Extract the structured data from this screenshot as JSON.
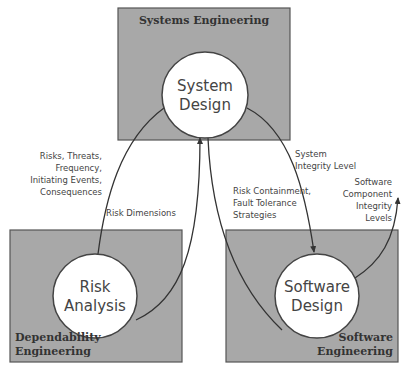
{
  "domains": {
    "systems": {
      "title": "Systems Engineering",
      "node": [
        "System",
        "Design"
      ]
    },
    "dependability": {
      "title": [
        "Dependability",
        "Engineering"
      ],
      "node": [
        "Risk",
        "Analysis"
      ]
    },
    "software": {
      "title": [
        "Software",
        "Engineering"
      ],
      "node": [
        "Software",
        "Design"
      ]
    }
  },
  "flows": {
    "risk_inputs": [
      "Risks, Threats,",
      "Frequency,",
      "Initiating Events,",
      "Consequences"
    ],
    "risk_dimensions": "Risk Dimensions",
    "risk_containment": [
      "Risk Containment,",
      "Fault Tolerance",
      "Strategies"
    ],
    "system_integrity": [
      "System",
      "Integrity Level"
    ],
    "component_integrity": [
      "Software",
      "Component",
      "Integrity",
      "Levels"
    ]
  },
  "colors": {
    "box_fill": "#a8a8a8",
    "circle_fill": "#ffffff",
    "line": "#333333"
  }
}
